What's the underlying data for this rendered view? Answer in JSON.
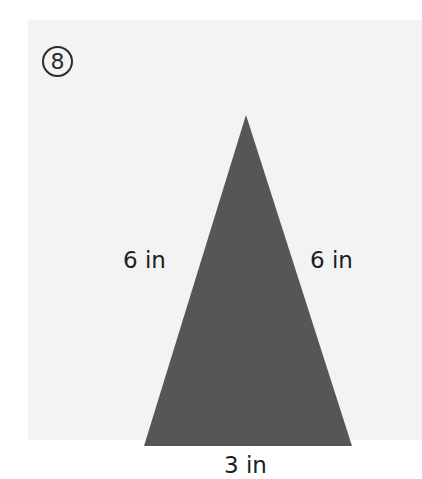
{
  "problem": {
    "number": "8",
    "icon": "circled-number-8"
  },
  "figure": {
    "shape": "isosceles-triangle",
    "fill_color": "#565656",
    "panel_color": "#f3f3f3",
    "vertices": {
      "apex": [
        246,
        115
      ],
      "base_left": [
        144,
        446
      ],
      "base_right": [
        352,
        446
      ]
    },
    "labels": {
      "left_side": "6 in",
      "right_side": "6 in",
      "base": "3 in"
    }
  }
}
